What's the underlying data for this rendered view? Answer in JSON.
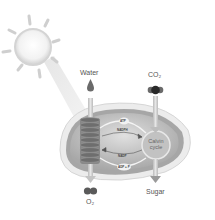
{
  "diagram": {
    "type": "photosynthesis-chloroplast",
    "labels": {
      "water": "Water",
      "co2": "CO₂",
      "o2": "O₂",
      "sugar": "Sugar",
      "calvin_line1": "Calvin",
      "calvin_line2": "cycle",
      "atp": "ATP",
      "nadph": "NADPH",
      "nadp": "NADP",
      "adp": "ADP + P"
    },
    "icons": [
      "sun-icon",
      "water-drop-icon",
      "co2-molecule-icon",
      "o2-molecule-icon",
      "thylakoid-stack-icon",
      "calvin-cycle-icon"
    ],
    "colors": {
      "background": "#ffffff",
      "chloroplast_outer": "#e4e4e4",
      "chloroplast_inner": "#9a9a9a",
      "stroma": "#c8c8c8",
      "thylakoid": "#7a7a7a",
      "arrow": "#bdbdbd",
      "text": "#555555"
    }
  }
}
